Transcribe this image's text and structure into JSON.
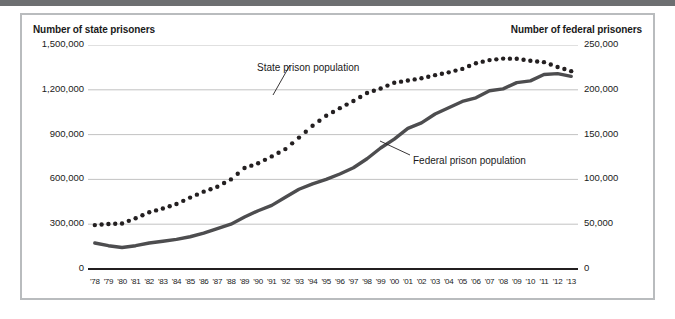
{
  "figure": {
    "left_axis_title": "Number of state prisoners",
    "right_axis_title": "Number of federal prisoners"
  },
  "annotations": {
    "state": "State prison population",
    "federal": "Federal prison population"
  },
  "colors": {
    "state_series": "#231f20",
    "federal_series": "#4d4d4f",
    "gridline": "#b3b3b3",
    "axis": "#231f20",
    "frame": "#b9bcbe",
    "top_rule": "#6d6f71",
    "background": "#ffffff",
    "text": "#1a1a1a"
  },
  "chart_data": {
    "type": "line",
    "title": "",
    "xlabel": "",
    "ylabel": "Number of state prisoners",
    "y2label": "Number of federal prisoners",
    "grid": true,
    "legend": "annotations-on-plot",
    "ylim": [
      0,
      1500000
    ],
    "y2lim": [
      0,
      250000
    ],
    "yticks": [
      "0",
      "300,000",
      "600,000",
      "900,000",
      "1,200,000",
      "1,500,000"
    ],
    "ytick_values": [
      0,
      300000,
      600000,
      900000,
      1200000,
      1500000
    ],
    "y2ticks": [
      "0",
      "50,000",
      "100,000",
      "150,000",
      "200,000",
      "250,000"
    ],
    "y2tick_values": [
      0,
      50000,
      100000,
      150000,
      200000,
      250000
    ],
    "x": [
      "'78",
      "'79",
      "'80",
      "'81",
      "'82",
      "'83",
      "'84",
      "'85",
      "'86",
      "'87",
      "'88",
      "'89",
      "'90",
      "'91",
      "'92",
      "'93",
      "'94",
      "'95",
      "'96",
      "'97",
      "'98",
      "'99",
      "'00",
      "'01",
      "'02",
      "'03",
      "'04",
      "'05",
      "'06",
      "'07",
      "'08",
      "'09",
      "'10",
      "'11",
      "'12",
      "'13"
    ],
    "series": [
      {
        "name": "State prison population",
        "axis": "left",
        "style": "dotted",
        "values": [
          294000,
          301000,
          305000,
          340000,
          380000,
          405000,
          435000,
          478000,
          518000,
          551000,
          600000,
          676000,
          708000,
          754000,
          803000,
          880000,
          959000,
          1026000,
          1077000,
          1125000,
          1179000,
          1209000,
          1247000,
          1262000,
          1277000,
          1298000,
          1317000,
          1340000,
          1378000,
          1399000,
          1409000,
          1408000,
          1395000,
          1385000,
          1353000,
          1325000
        ]
      },
      {
        "name": "Federal prison population",
        "axis": "right",
        "style": "solid",
        "values": [
          29000,
          26000,
          24000,
          26000,
          29000,
          31000,
          33000,
          36000,
          40000,
          45000,
          50000,
          58000,
          65000,
          71000,
          80000,
          89000,
          95000,
          100000,
          106000,
          113000,
          123000,
          135000,
          145000,
          157000,
          163000,
          173000,
          180000,
          187000,
          191000,
          199000,
          201000,
          208000,
          210000,
          217000,
          218000,
          215000
        ]
      }
    ]
  }
}
